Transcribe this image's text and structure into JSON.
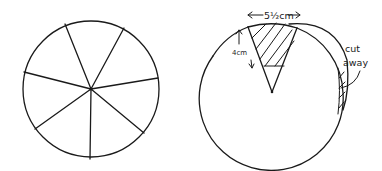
{
  "diagram": {
    "left_figure": {
      "description": "circle divided into 7 sectors",
      "sectors": 7
    },
    "right_figure": {
      "description": "circle with one sector removed and rotated; overlapping region hatched",
      "labels": {
        "width": "5½cm",
        "height": "4cm",
        "cut_away_line1": "cut",
        "cut_away_line2": "away"
      }
    }
  }
}
